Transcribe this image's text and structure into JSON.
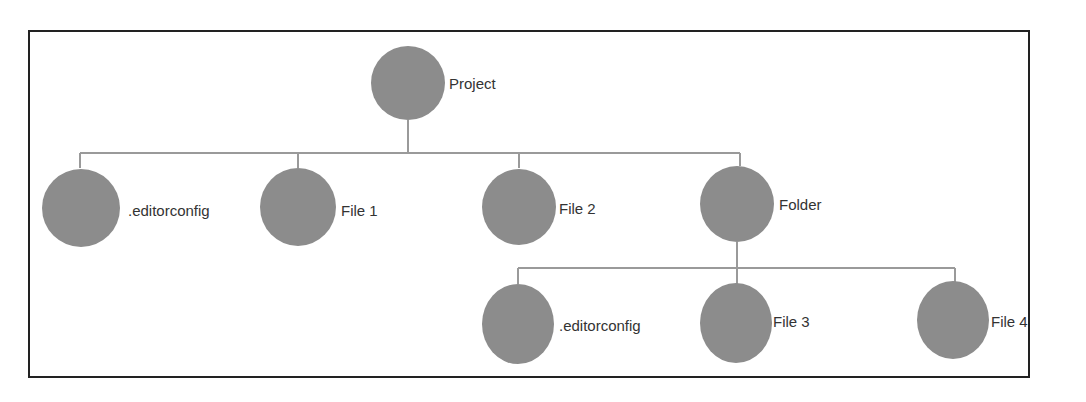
{
  "diagram": {
    "type": "tree",
    "colors": {
      "node": "#8c8c8c",
      "connector": "#9a9a9a",
      "border": "#222222",
      "text": "#333333"
    },
    "nodes": [
      {
        "id": "project",
        "label": "Project",
        "cx": 408,
        "cy": 83,
        "r": 37
      },
      {
        "id": "editorconfig1",
        "label": ".editorconfig",
        "cx": 81,
        "cy": 208,
        "r": 39
      },
      {
        "id": "file1",
        "label": "File 1",
        "cx": 298,
        "cy": 207,
        "r": 39
      },
      {
        "id": "file2",
        "label": "File 2",
        "cx": 519,
        "cy": 207,
        "r": 38
      },
      {
        "id": "folder",
        "label": "Folder",
        "cx": 737,
        "cy": 204,
        "r": 38
      },
      {
        "id": "editorconfig2",
        "label": ".editorconfig",
        "cx": 518,
        "cy": 324,
        "r": 38
      },
      {
        "id": "file3",
        "label": "File 3",
        "cx": 736,
        "cy": 323,
        "r": 38
      },
      {
        "id": "file4",
        "label": "File 4",
        "cx": 953,
        "cy": 320,
        "r": 38
      }
    ],
    "edges": [
      [
        "project",
        "editorconfig1"
      ],
      [
        "project",
        "file1"
      ],
      [
        "project",
        "file2"
      ],
      [
        "project",
        "folder"
      ],
      [
        "folder",
        "editorconfig2"
      ],
      [
        "folder",
        "file3"
      ],
      [
        "folder",
        "file4"
      ]
    ]
  }
}
